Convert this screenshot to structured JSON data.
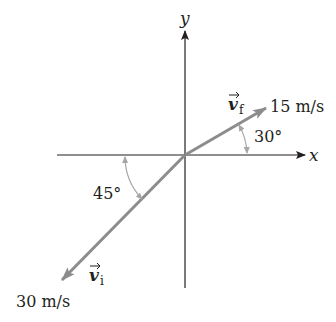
{
  "diagram": {
    "axes": {
      "x_label": "x",
      "y_label": "y"
    },
    "vectors": {
      "final": {
        "symbol": "v",
        "subscript": "f",
        "magnitude_label": "15 m/s",
        "angle_label": "30°",
        "angle_deg": 30,
        "direction": "above +x axis"
      },
      "initial": {
        "symbol": "v",
        "subscript": "i",
        "magnitude_label": "30 m/s",
        "angle_label": "45°",
        "angle_deg": 45,
        "direction": "below -x axis"
      }
    },
    "colors": {
      "axis": "#231f20",
      "vector": "#8c8c8c",
      "angle_arc": "#a6a6a6",
      "text": "#231f20"
    }
  }
}
